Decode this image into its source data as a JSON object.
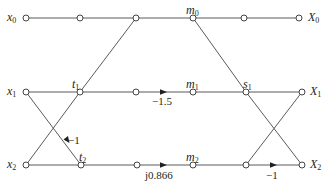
{
  "diagram": {
    "type": "signal-flow-graph",
    "colors": {
      "line": "#5a5a5a",
      "node_fill": "#ffffff",
      "node_stroke": "#444444",
      "text": "#231f20"
    },
    "inputs": [
      {
        "base": "x",
        "sub": "0"
      },
      {
        "base": "x",
        "sub": "1"
      },
      {
        "base": "x",
        "sub": "2"
      }
    ],
    "outputs": [
      {
        "base": "X",
        "sub": "0"
      },
      {
        "base": "X",
        "sub": "1"
      },
      {
        "base": "X",
        "sub": "2"
      }
    ],
    "node_labels": {
      "t1": {
        "base": "t",
        "sub": "1"
      },
      "t2": {
        "base": "t",
        "sub": "2"
      },
      "m0": {
        "base": "m",
        "sub": "0"
      },
      "m1": {
        "base": "m",
        "sub": "1"
      },
      "m2": {
        "base": "m",
        "sub": "2"
      },
      "s1": {
        "base": "s",
        "sub": "1"
      }
    },
    "gains": {
      "x1_to_t2": "−1",
      "row1_mult": "−1.5",
      "row2_mult": "j0.866",
      "row2_out": "−1"
    }
  }
}
